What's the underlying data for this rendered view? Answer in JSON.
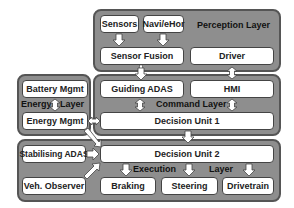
{
  "layers": {
    "perception": {
      "label": "Perception Layer"
    },
    "command": {
      "label": "Command Layer"
    },
    "energy": {
      "label_left": "Energy",
      "label_right": "Layer"
    },
    "execution": {
      "label_left": "Execution",
      "label_right": "Layer"
    }
  },
  "boxes": {
    "sensors": "Sensors",
    "navi": "Navi/eHor",
    "sensor_fusion": "Sensor Fusion",
    "driver": "Driver",
    "guiding_adas": "Guiding ADAS",
    "hmi": "HMI",
    "decision_unit_1": "Decision Unit 1",
    "battery_mgmt": "Battery Mgmt",
    "energy_mgmt": "Energy Mgmt",
    "stabilising_adas": "Stabilising ADAS",
    "decision_unit_2": "Decision Unit 2",
    "veh_observer": "Veh. Observer",
    "braking": "Braking",
    "steering": "Steering",
    "drivetrain": "Drivetrain"
  },
  "colors": {
    "layer_fill": "#8e8e8e",
    "box_fill": "#ffffff",
    "border": "#444444"
  }
}
